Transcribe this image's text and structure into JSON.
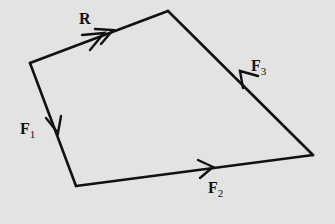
{
  "diagram": {
    "type": "vector-polygon",
    "background": "#e3e3e3",
    "stroke_color": "#111111",
    "vertices": {
      "A": [
        30,
        63
      ],
      "B": [
        168,
        11
      ],
      "C": [
        313,
        155
      ],
      "D": [
        76,
        186
      ]
    },
    "vectors": [
      {
        "id": "F1",
        "label_main": "F",
        "label_sub": "1",
        "from": "A",
        "to": "D"
      },
      {
        "id": "F2",
        "label_main": "F",
        "label_sub": "2",
        "from": "D",
        "to": "C"
      },
      {
        "id": "F3",
        "label_main": "F",
        "label_sub": "3",
        "from": "C",
        "to": "B"
      },
      {
        "id": "R",
        "label_main": "R",
        "label_sub": "",
        "from": "A",
        "to": "B",
        "double_arrow": true
      }
    ]
  },
  "labels": {
    "r": "R",
    "f1_main": "F",
    "f1_sub": "1",
    "f2_main": "F",
    "f2_sub": "2",
    "f3_main": "F",
    "f3_sub": "3"
  }
}
